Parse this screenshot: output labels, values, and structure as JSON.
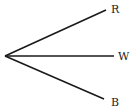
{
  "diagram": {
    "type": "rays-from-point",
    "origin": {
      "x": 5,
      "y": 56
    },
    "rays": [
      {
        "label": "R",
        "end": {
          "x": 106,
          "y": 10
        },
        "label_pos": {
          "x": 111,
          "y": 13
        }
      },
      {
        "label": "W",
        "end": {
          "x": 114,
          "y": 56
        },
        "label_pos": {
          "x": 119,
          "y": 60
        }
      },
      {
        "label": "B",
        "end": {
          "x": 104,
          "y": 99
        },
        "label_pos": {
          "x": 111,
          "y": 106
        }
      }
    ],
    "stroke_color": "#1a1a1a"
  }
}
